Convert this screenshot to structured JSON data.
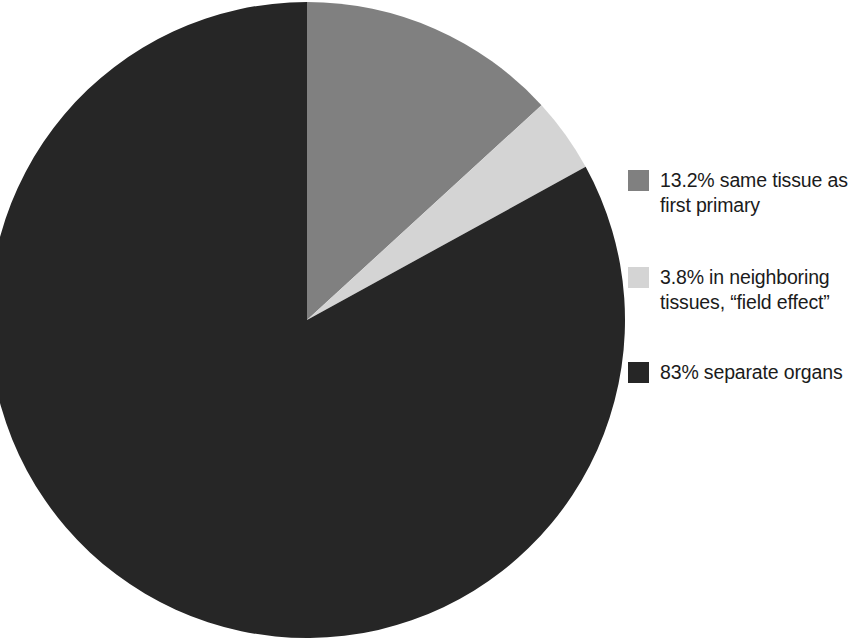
{
  "chart_data": {
    "type": "pie",
    "title": "",
    "subtitle": "",
    "xlabel": "",
    "ylabel": "",
    "grid": false,
    "legend_position": "right",
    "units": "percent",
    "start_angle_deg": 0,
    "direction": "clockwise",
    "categories": [
      "same tissue as first primary",
      "in neighboring tissues, “field effect”",
      "separate organs"
    ],
    "values": [
      13.2,
      3.8,
      83
    ],
    "value_labels": [
      "13.2%",
      "3.8%",
      "83%"
    ],
    "colors": [
      "#808080",
      "#d4d4d4",
      "#262626"
    ],
    "slices": [
      {
        "label": "13.2% same tissue as first primary",
        "value": 13.2,
        "value_label": "13.2%",
        "name": "same tissue as first primary",
        "color": "#808080",
        "start_deg": 0,
        "end_deg": 47.52
      },
      {
        "label": "3.8% in neighboring tissues, “field effect”",
        "value": 3.8,
        "value_label": "3.8%",
        "name": "in neighboring tissues, “field effect”",
        "color": "#d4d4d4",
        "start_deg": 47.52,
        "end_deg": 61.2
      },
      {
        "label": "83% separate organs",
        "value": 83,
        "value_label": "83%",
        "name": "separate organs",
        "color": "#262626",
        "start_deg": 61.2,
        "end_deg": 360
      }
    ]
  },
  "legend": {
    "items": [
      {
        "swatch_color": "#808080",
        "label": "13.2% same tissue as\nfirst primary"
      },
      {
        "swatch_color": "#d4d4d4",
        "label": "3.8% in neighboring\ntissues, “field effect”"
      },
      {
        "swatch_color": "#262626",
        "label": "83% separate organs"
      }
    ]
  },
  "canvas": {
    "background": "#ffffff",
    "pie": {
      "center_x": 307,
      "center_y": 320,
      "radius_x": 318,
      "radius_y": 318
    }
  }
}
